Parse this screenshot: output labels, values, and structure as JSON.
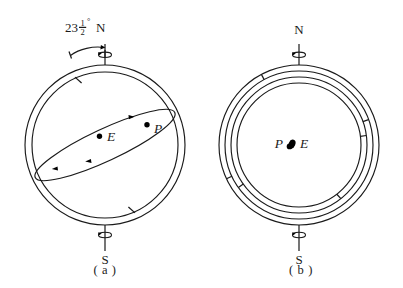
{
  "figure": {
    "background_color": "#ffffff",
    "ink_color": "#1a1a1a"
  },
  "panel_a": {
    "caption": "( a )",
    "north_pole_label": "N",
    "south_pole_label": "S",
    "tilt_angle": {
      "whole": "23",
      "numerator": "1",
      "denominator": "2",
      "degree_symbol": "°",
      "full_text": "23 1/2°",
      "value_degrees": 23.5,
      "measured_from": "vertical"
    },
    "bodies": [
      {
        "id": "E",
        "label": "E",
        "name": "earth"
      },
      {
        "id": "P",
        "label": "P",
        "name": "planet"
      }
    ],
    "north_spin_icon": "rotation-arrow-icon",
    "south_spin_icon": "rotation-arrow-icon",
    "ring_ticks_count": 2,
    "orbit_arrow_count": 3,
    "orbit_direction": "counterclockwise"
  },
  "panel_b": {
    "caption": "( b )",
    "north_pole_label": "N",
    "south_pole_label": "S",
    "bodies": [
      {
        "id": "P",
        "label": "P",
        "name": "planet"
      },
      {
        "id": "E",
        "label": "E",
        "name": "earth"
      }
    ],
    "north_spin_icon": "rotation-arrow-icon",
    "south_spin_icon": "rotation-arrow-icon",
    "ring_count": 4,
    "ring_ticks_count": 6
  }
}
